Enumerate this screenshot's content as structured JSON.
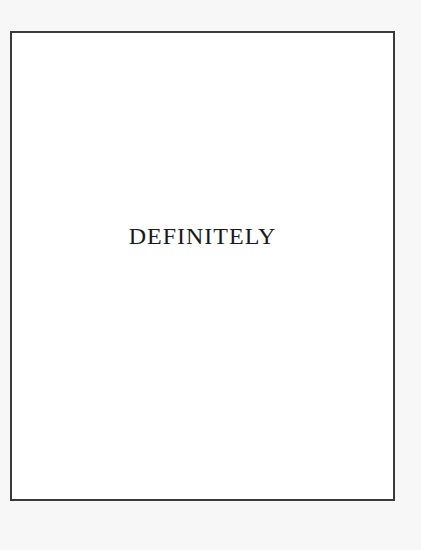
{
  "page": {
    "word": "DEFINITELY"
  }
}
